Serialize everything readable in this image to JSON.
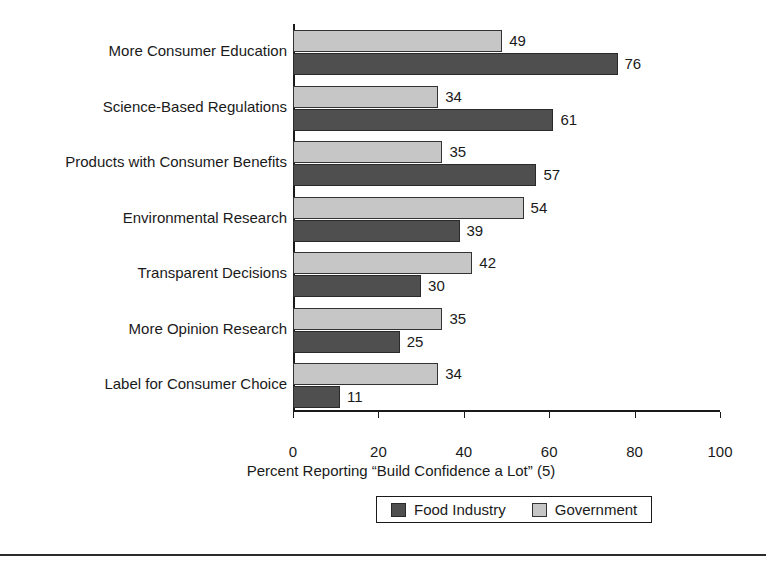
{
  "chart_data": {
    "type": "bar",
    "orientation": "horizontal",
    "title": "",
    "xlabel": "Percent Reporting “Build Confidence a Lot” (5)",
    "ylabel": "",
    "xlim": [
      0,
      100
    ],
    "xticks": [
      0,
      20,
      40,
      60,
      80,
      100
    ],
    "grid": false,
    "legend_position": "bottom",
    "categories": [
      "More Consumer Education",
      "Science-Based Regulations",
      "Products with Consumer Benefits",
      "Environmental Research",
      "Transparent Decisions",
      "More Opinion Research",
      "Label for Consumer Choice"
    ],
    "series": [
      {
        "name": "Government",
        "color": "#c6c6c6",
        "values": [
          49,
          34,
          35,
          54,
          42,
          35,
          34
        ]
      },
      {
        "name": "Food Industry",
        "color": "#4f4f4f",
        "values": [
          76,
          61,
          57,
          39,
          30,
          25,
          11
        ]
      }
    ],
    "series_draw_order": [
      "Government",
      "Food Industry"
    ],
    "legend_order": [
      "Food Industry",
      "Government"
    ]
  },
  "axis": {
    "tick_labels": [
      "0",
      "20",
      "40",
      "60",
      "80",
      "100"
    ]
  },
  "legend": {
    "items": [
      {
        "label": "Food Industry",
        "color": "#4f4f4f"
      },
      {
        "label": "Government",
        "color": "#c6c6c6"
      }
    ]
  }
}
